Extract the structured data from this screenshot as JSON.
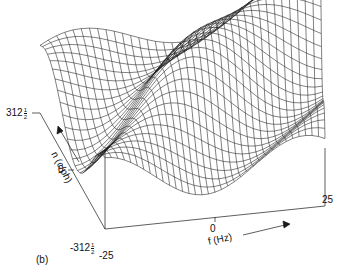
{
  "panel_label": "(b)",
  "axes": {
    "n": {
      "title": "n (c/ph)",
      "ticks": [
        {
          "whole": "312",
          "num": "1",
          "den": "2",
          "sign": ""
        },
        {
          "whole": "0",
          "num": "",
          "den": "",
          "sign": ""
        },
        {
          "whole": "312",
          "num": "1",
          "den": "2",
          "sign": "-"
        }
      ]
    },
    "f": {
      "title": "f (Hz)",
      "ticks": [
        "-25",
        "0",
        "25"
      ]
    }
  },
  "colors": {
    "line": "#1a1a1a",
    "background": "#ffffff"
  },
  "chart_data": {
    "type": "surface",
    "title": "",
    "panel": "(b)",
    "xlabel": "f (Hz)",
    "ylabel": "n (c/ph)",
    "xlim": [
      -25,
      25
    ],
    "ylim": [
      -312.5,
      312.5
    ],
    "x_ticks": [
      -25,
      0,
      25
    ],
    "y_ticks": [
      -312.5,
      0,
      312.5
    ],
    "grid": false,
    "render": "wireframe mesh"
  }
}
